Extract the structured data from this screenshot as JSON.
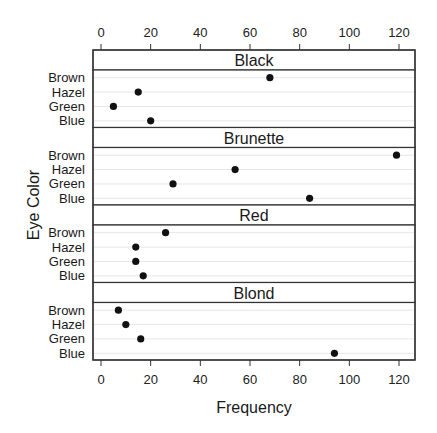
{
  "chart_data": {
    "type": "scatter",
    "subtype": "dotplot",
    "title": "",
    "xlabel": "Frequency",
    "ylabel": "Eye Color",
    "xlim": [
      -3,
      127
    ],
    "x_ticks": [
      0,
      20,
      40,
      60,
      80,
      100,
      120
    ],
    "categories": [
      "Brown",
      "Hazel",
      "Green",
      "Blue"
    ],
    "grid": "horizontal light gray lines per category",
    "panels": [
      {
        "name": "Black",
        "values": {
          "Brown": 68,
          "Hazel": 15,
          "Green": 5,
          "Blue": 20
        }
      },
      {
        "name": "Brunette",
        "values": {
          "Brown": 119,
          "Hazel": 54,
          "Green": 29,
          "Blue": 84
        }
      },
      {
        "name": "Red",
        "values": {
          "Brown": 26,
          "Hazel": 14,
          "Green": 14,
          "Blue": 17
        }
      },
      {
        "name": "Blond",
        "values": {
          "Brown": 7,
          "Hazel": 10,
          "Green": 16,
          "Blue": 94
        }
      }
    ]
  },
  "colors": {
    "frame": "#333333",
    "point": "#111111",
    "grid": "#e6e6e6",
    "strip_bg": "#ffffff"
  }
}
